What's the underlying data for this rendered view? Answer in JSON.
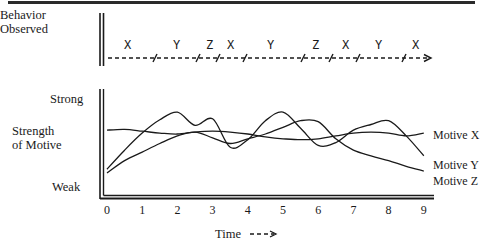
{
  "behavior_panel": {
    "label_line1": "Behavior",
    "label_line2": "Observed",
    "sequence": [
      {
        "letter": "X",
        "x": 128
      },
      {
        "letter": "Y",
        "x": 177
      },
      {
        "letter": "Z",
        "x": 210
      },
      {
        "letter": "X",
        "x": 231
      },
      {
        "letter": "Y",
        "x": 271
      },
      {
        "letter": "Z",
        "x": 316
      },
      {
        "letter": "X",
        "x": 346
      },
      {
        "letter": "Y",
        "x": 379
      },
      {
        "letter": "X",
        "x": 416
      }
    ],
    "break_marks_x": [
      155,
      198,
      218,
      245,
      303,
      331,
      358,
      404
    ]
  },
  "motive_panel": {
    "y_top_label": "Strong",
    "y_axis_label_line1": "Strength",
    "y_axis_label_line2": "of Motive",
    "y_bottom_label": "Weak",
    "x_axis_label": "Time",
    "x_ticks": [
      "0",
      "1",
      "2",
      "3",
      "4",
      "5",
      "6",
      "7",
      "8",
      "9"
    ],
    "series_labels": {
      "x": "Motive X",
      "y": "Motive Y",
      "z": "Motive Z"
    }
  },
  "chart_data": {
    "type": "line",
    "title": "",
    "xlabel": "Time",
    "ylabel": "Strength of Motive",
    "y_range_labels": [
      "Weak",
      "Strong"
    ],
    "x": [
      0,
      0.5,
      1,
      1.5,
      2,
      2.5,
      3,
      3.5,
      4,
      4.5,
      5,
      5.5,
      6,
      6.5,
      7,
      7.5,
      8,
      8.5,
      9
    ],
    "series": [
      {
        "name": "Motive X",
        "values": [
          6.4,
          6.5,
          6.3,
          6.1,
          6.0,
          6.2,
          6.3,
          6.2,
          6.0,
          5.7,
          5.5,
          5.4,
          5.5,
          5.8,
          6.1,
          6.2,
          6.1,
          5.8,
          6.1
        ]
      },
      {
        "name": "Motive Y",
        "values": [
          2.3,
          4.3,
          6.1,
          7.5,
          8.3,
          6.9,
          7.6,
          4.6,
          5.4,
          7.4,
          8.3,
          6.6,
          4.8,
          5.1,
          6.4,
          7.0,
          7.4,
          5.8,
          3.7
        ]
      },
      {
        "name": "Motive Z",
        "values": [
          1.9,
          3.2,
          4.1,
          5.0,
          5.8,
          6.2,
          5.6,
          5.0,
          5.5,
          6.0,
          6.7,
          7.4,
          7.3,
          5.5,
          4.3,
          3.7,
          3.2,
          2.6,
          2.1
        ]
      }
    ],
    "behavior_sequence": [
      "X",
      "Y",
      "Z",
      "X",
      "Y",
      "Z",
      "X",
      "Y",
      "X"
    ],
    "grid": false,
    "legend_position": "right (inline labels)"
  }
}
